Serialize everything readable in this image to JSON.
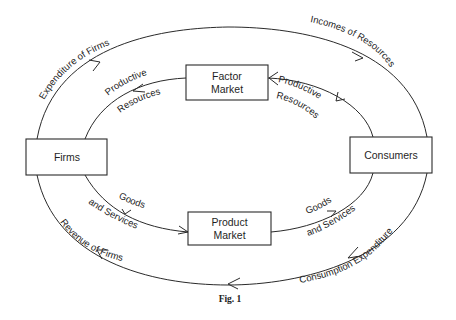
{
  "diagram": {
    "nodes": {
      "firms": "Firms",
      "consumers": "Consumers",
      "factor_market": {
        "line1": "Factor",
        "line2": "Market"
      },
      "product_market": {
        "line1": "Product",
        "line2": "Market"
      }
    },
    "flows": {
      "expenditure_of_firms": "Expenditure of Firms",
      "incomes_of_resources": "Incomes of Resources",
      "productive_resources_left": {
        "line1": "Productive",
        "line2": "Resources"
      },
      "productive_resources_right": {
        "line1": "Productive",
        "line2": "Resources"
      },
      "goods_services_left": {
        "line1": "Goods",
        "line2": "and Services"
      },
      "goods_services_right": {
        "line1": "Goods",
        "line2": "and Services"
      },
      "revenue_of_firms": "Revenue of Firms",
      "consumption_expenditure": "Consumption Expenditure"
    },
    "caption": "Fig. 1"
  }
}
